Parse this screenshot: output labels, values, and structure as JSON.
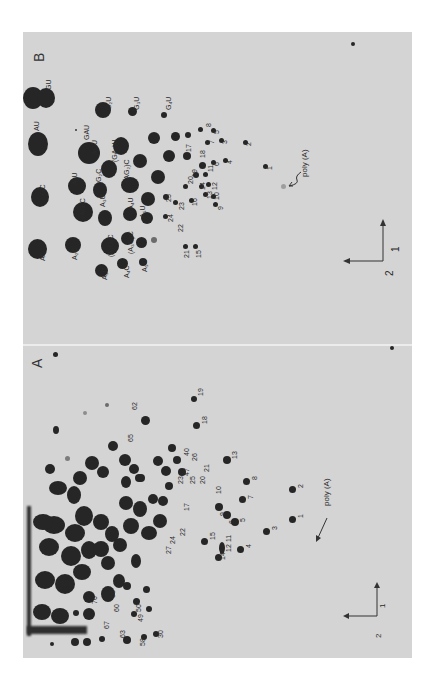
{
  "figure": {
    "panels": [
      {
        "letter": "B",
        "spot_labels": [
          "AC",
          "GC",
          "AU",
          "GU",
          "A2C",
          "(AG)C",
          "A2U",
          "GAU",
          "AGU",
          "G2U",
          "A3C",
          "(A2G)C",
          "A3U",
          "G2C",
          "(AG2)C",
          "(GA2)U",
          "G3U",
          "A4C",
          "(A3G)C",
          "A4U",
          "A5C",
          "A5U",
          "A6C",
          "G4U"
        ],
        "numbered_spots": [
          "1",
          "2",
          "3",
          "4",
          "5",
          "6",
          "7",
          "8",
          "9",
          "10",
          "11",
          "12",
          "13",
          "14",
          "15",
          "16",
          "17",
          "18",
          "19",
          "20",
          "21",
          "22",
          "23",
          "24",
          "25"
        ],
        "poly_a_label": "poly (A)",
        "axis": {
          "dim1": "1",
          "dim2": "2"
        }
      },
      {
        "letter": "A",
        "numbered_spots": [
          "1",
          "2",
          "3",
          "4",
          "5",
          "6",
          "7",
          "8",
          "9",
          "10",
          "11",
          "12",
          "13",
          "14",
          "15",
          "16",
          "17",
          "18",
          "19",
          "20",
          "21",
          "22",
          "23",
          "24",
          "25",
          "26",
          "27",
          "28",
          "29",
          "30",
          "31",
          "32",
          "33",
          "34",
          "35",
          "36",
          "37",
          "38",
          "39",
          "40",
          "41",
          "42",
          "43",
          "44",
          "45",
          "46",
          "47",
          "48",
          "49",
          "50",
          "51",
          "52",
          "53",
          "54",
          "55",
          "56",
          "57",
          "58",
          "59",
          "60",
          "61",
          "62",
          "63",
          "64",
          "65",
          "66",
          "67",
          "68",
          "69",
          "70"
        ],
        "poly_a_label": "poly (A)",
        "axis": {
          "dim1": "1",
          "dim2": "2"
        }
      }
    ],
    "labels_b": {
      "AC": "AC",
      "GC": "GC",
      "AU": "AU",
      "GU": "GU",
      "A2C": "A₂C",
      "AGC": "(AG)C",
      "A2U": "A₂U",
      "GAU": "GAU",
      "AGU": "AGU",
      "G2U": "G₂U",
      "A3C": "A₃C",
      "A2GC": "(A₂G)C",
      "A3U": "A₃U",
      "G2C": "G₂C",
      "AG2C": "(AG₂)C",
      "GA2U": "(GA₂)U",
      "G3U": "G₃U",
      "A4C": "A₄C",
      "A3GC": "(A₃G)C",
      "A4U": "A₄U",
      "A5C": "A₅C",
      "A5U": "A₅U",
      "A6C": "A₆C",
      "G4U": "G₄U",
      "n1": "1",
      "n2": "2",
      "n3": "3",
      "n4": "4",
      "n5": "5",
      "n6": "6",
      "n7": "7",
      "n8": "8",
      "n9": "9",
      "n10": "10",
      "n11": "11",
      "n12": "12",
      "n13": "13",
      "n14": "14",
      "n15": "15",
      "n16": "16",
      "n17": "17",
      "n18": "18",
      "n19": "19",
      "n20": "20",
      "n21": "21",
      "n22": "22",
      "n23": "23",
      "n24": "24",
      "n25": "25",
      "letter": "B",
      "poly": "poly (A)",
      "ax1": "1",
      "ax2": "2"
    },
    "labels_a": {
      "letter": "A",
      "poly": "poly (A)",
      "ax1": "1",
      "ax2": "2",
      "n1": "1",
      "n2": "2",
      "n3": "3",
      "n4": "4",
      "n5": "5",
      "n6": "6",
      "n7": "7",
      "n8": "8",
      "n9": "9",
      "n10": "10",
      "n11": "11",
      "n12": "12",
      "n13": "13",
      "n14": "14",
      "n15": "15",
      "n16": "16",
      "n17": "17",
      "n18": "18",
      "n19": "19",
      "n20": "20",
      "n21": "21",
      "n22": "22",
      "n23": "23",
      "n24": "24",
      "n25": "25",
      "n26": "26",
      "n27": "27",
      "n30": "30",
      "n35": "35",
      "n38": "38",
      "n40": "40",
      "n41": "41",
      "n42": "42",
      "n43": "43",
      "n44": "44",
      "n45": "45",
      "n47": "47",
      "n48": "48",
      "n49": "49",
      "n50": "50",
      "n51": "51",
      "n53": "53",
      "n54": "54",
      "n55": "55",
      "n56": "56",
      "n57": "57",
      "n58": "58",
      "n59": "59",
      "n60": "60",
      "n61": "61",
      "n62": "62",
      "n63": "63",
      "n64": "64",
      "n65": "65",
      "n66": "66",
      "n67": "67",
      "n68": "68",
      "n69": "69",
      "n70": "70"
    }
  }
}
